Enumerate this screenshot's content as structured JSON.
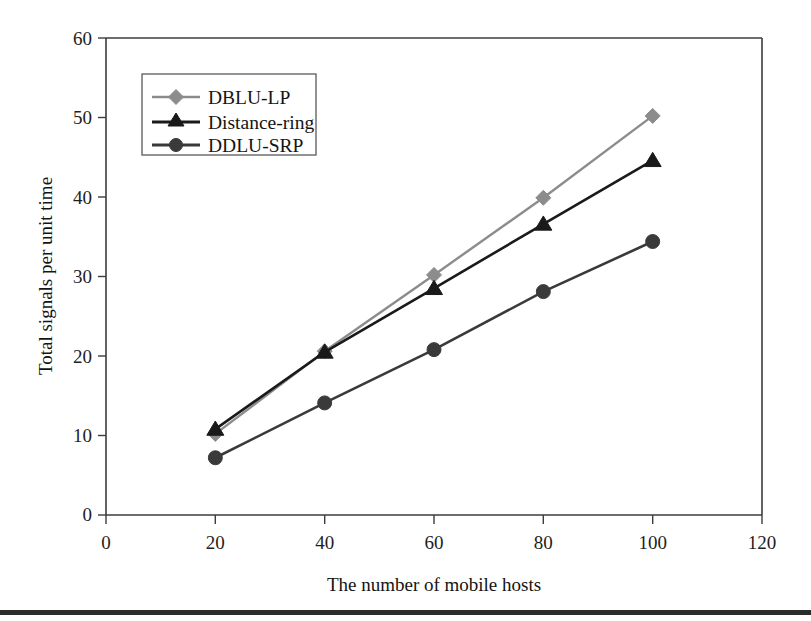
{
  "chart_data": {
    "type": "line",
    "title": "",
    "xlabel": "The number of mobile hosts",
    "ylabel": "Total signals per unit time",
    "x": [
      20,
      40,
      60,
      80,
      100
    ],
    "xlim": [
      0,
      120
    ],
    "ylim": [
      0,
      60
    ],
    "xticks": [
      0,
      20,
      40,
      60,
      80,
      100,
      120
    ],
    "yticks": [
      0,
      10,
      20,
      30,
      40,
      50,
      60
    ],
    "xtick_labels": [
      "0",
      "20",
      "40",
      "60",
      "80",
      "100",
      "120"
    ],
    "ytick_labels": [
      "0",
      "10",
      "20",
      "30",
      "40",
      "50",
      "60"
    ],
    "grid": false,
    "legend_position": "upper-left-inside",
    "series": [
      {
        "name": "DBLU-LP",
        "marker": "diamond",
        "color": "#8c8c8c",
        "values": [
          10.2,
          20.6,
          30.2,
          39.9,
          50.2
        ]
      },
      {
        "name": "Distance-ring",
        "marker": "triangle",
        "color": "#1a1a1a",
        "values": [
          10.8,
          20.5,
          28.5,
          36.6,
          44.6
        ]
      },
      {
        "name": "DDLU-SRP",
        "marker": "circle",
        "color": "#3a3a3a",
        "values": [
          7.2,
          14.1,
          20.8,
          28.1,
          34.4
        ]
      }
    ]
  },
  "legend": {
    "items": [
      {
        "label": "DBLU-LP"
      },
      {
        "label": "Distance-ring"
      },
      {
        "label": "DDLU-SRP"
      }
    ]
  },
  "axes": {
    "x_title": "The number of mobile hosts",
    "y_title": "Total signals per unit time",
    "x_tick_0": "0",
    "x_tick_1": "20",
    "x_tick_2": "40",
    "x_tick_3": "60",
    "x_tick_4": "80",
    "x_tick_5": "100",
    "x_tick_6": "120",
    "y_tick_0": "0",
    "y_tick_1": "10",
    "y_tick_2": "20",
    "y_tick_3": "30",
    "y_tick_4": "40",
    "y_tick_5": "50",
    "y_tick_6": "60"
  },
  "colors": {
    "series_dblu_lp": "#8c8c8c",
    "series_distance_ring": "#1a1a1a",
    "series_ddlu_srp": "#3a3a3a",
    "axis": "#3c3c3c",
    "footer_rule": "#2b2b2b"
  }
}
